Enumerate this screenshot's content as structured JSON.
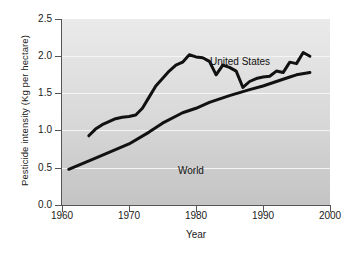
{
  "chart_data": {
    "type": "line",
    "title": "",
    "xlabel": "Year",
    "ylabel": "Pesticide intensity (Kg per hectare)",
    "xlim": [
      1960,
      2000
    ],
    "ylim": [
      0.0,
      2.5
    ],
    "xticks": [
      "1960",
      "1970",
      "1980",
      "1990",
      "2000"
    ],
    "yticks": [
      "0.0",
      "0.5",
      "1.0",
      "1.5",
      "2.0",
      "2.5"
    ],
    "grid": "horizontal",
    "legend_position": "inline-annotations",
    "line_color": "#111111",
    "plot_background_top": "#eaeaea",
    "plot_background_bottom": "#c4c4c4",
    "gridline_color": "#f5f5f5",
    "series": [
      {
        "name": "United States",
        "x": [
          1964,
          1965,
          1966,
          1967,
          1968,
          1969,
          1970,
          1971,
          1972,
          1973,
          1974,
          1975,
          1976,
          1977,
          1978,
          1979,
          1980,
          1981,
          1982,
          1983,
          1984,
          1985,
          1986,
          1987,
          1988,
          1989,
          1990,
          1991,
          1992,
          1993,
          1994,
          1995,
          1996,
          1997
        ],
        "values": [
          0.93,
          1.02,
          1.08,
          1.12,
          1.16,
          1.18,
          1.19,
          1.21,
          1.3,
          1.45,
          1.6,
          1.7,
          1.8,
          1.88,
          1.92,
          2.02,
          1.99,
          1.98,
          1.93,
          1.75,
          1.88,
          1.85,
          1.8,
          1.58,
          1.66,
          1.7,
          1.72,
          1.73,
          1.8,
          1.78,
          1.92,
          1.9,
          2.05,
          2.0
        ]
      },
      {
        "name": "World",
        "x": [
          1961,
          1965,
          1970,
          1973,
          1975,
          1978,
          1980,
          1982,
          1985,
          1988,
          1990,
          1992,
          1994,
          1995,
          1997
        ],
        "values": [
          0.48,
          0.63,
          0.82,
          0.98,
          1.1,
          1.24,
          1.3,
          1.38,
          1.47,
          1.55,
          1.6,
          1.66,
          1.72,
          1.75,
          1.78
        ]
      }
    ],
    "annotations": [
      {
        "text": "United States",
        "x": 1977,
        "y": 2.3
      },
      {
        "text": "World",
        "x": 1968.5,
        "y": 0.75
      }
    ]
  }
}
